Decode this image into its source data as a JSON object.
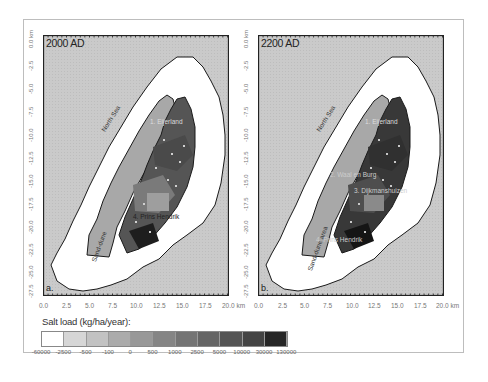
{
  "figure": {
    "panels": [
      {
        "id": "a",
        "title": "2000 AD",
        "letter": "a.",
        "labels": {
          "north_sea": "North Sea",
          "sand_dunes": "Sand-dune",
          "region1": "1. Eijerland",
          "region2": "2. Waal en Burg",
          "region3": "3. Dijkmanshuizen",
          "region4": "4. Prins Hendrik"
        }
      },
      {
        "id": "b",
        "title": "2200 AD",
        "letter": "b.",
        "labels": {
          "north_sea": "North Sea",
          "sand_dunes": "Sand-dune area",
          "region1": "1. Eijerland",
          "region2": "2. Waal en Burg",
          "region3": "3. Dijkmanshuizen",
          "region4": "4. Prins Hendrik"
        }
      }
    ],
    "y_axis_ticks": [
      "0.0 km",
      "-2.5",
      "-5.0",
      "-7.5",
      "-10.0",
      "-12.5",
      "-15.0",
      "-17.5",
      "-20.0",
      "-22.5",
      "-25.0",
      "-27.5"
    ],
    "x_axis_ticks": [
      "0.0",
      "2.5",
      "5.0",
      "7.5",
      "10.0",
      "12.5",
      "15.0",
      "17.5",
      "20.0 km"
    ],
    "legend": {
      "title": "Salt load (kg/ha/year):",
      "labels": [
        "-60000",
        "-2500",
        "-500",
        "-100",
        "0",
        "500",
        "1000",
        "2500",
        "5000",
        "10000",
        "30000",
        "130000"
      ],
      "colors": [
        "#ffffff",
        "#d6d6d6",
        "#c2c2c2",
        "#ababab",
        "#989898",
        "#858585",
        "#747474",
        "#656565",
        "#545454",
        "#444444",
        "#262626"
      ]
    },
    "colors": {
      "sea": "#c9c9c9",
      "nearshore": "#ffffff",
      "dunes": "#a9a9a9",
      "land_dark": "#505050",
      "land_mid": "#6e6e6e",
      "border": "#1a1a1a"
    }
  }
}
